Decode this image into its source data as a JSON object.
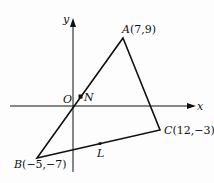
{
  "diagram": {
    "type": "coordinate-geometry-triangle",
    "axes": {
      "x_label": "x",
      "y_label": "y",
      "origin_label": "O"
    },
    "points": {
      "A": {
        "label": "A",
        "coords": "(7,9)"
      },
      "B": {
        "label": "B",
        "coords": "(−5,−7)"
      },
      "C": {
        "label": "C",
        "coords": "(12,−3)"
      },
      "N": {
        "label": "N"
      },
      "L": {
        "label": "L"
      }
    },
    "colors": {
      "stroke": "#111111",
      "background": "#fdfdfd"
    }
  }
}
